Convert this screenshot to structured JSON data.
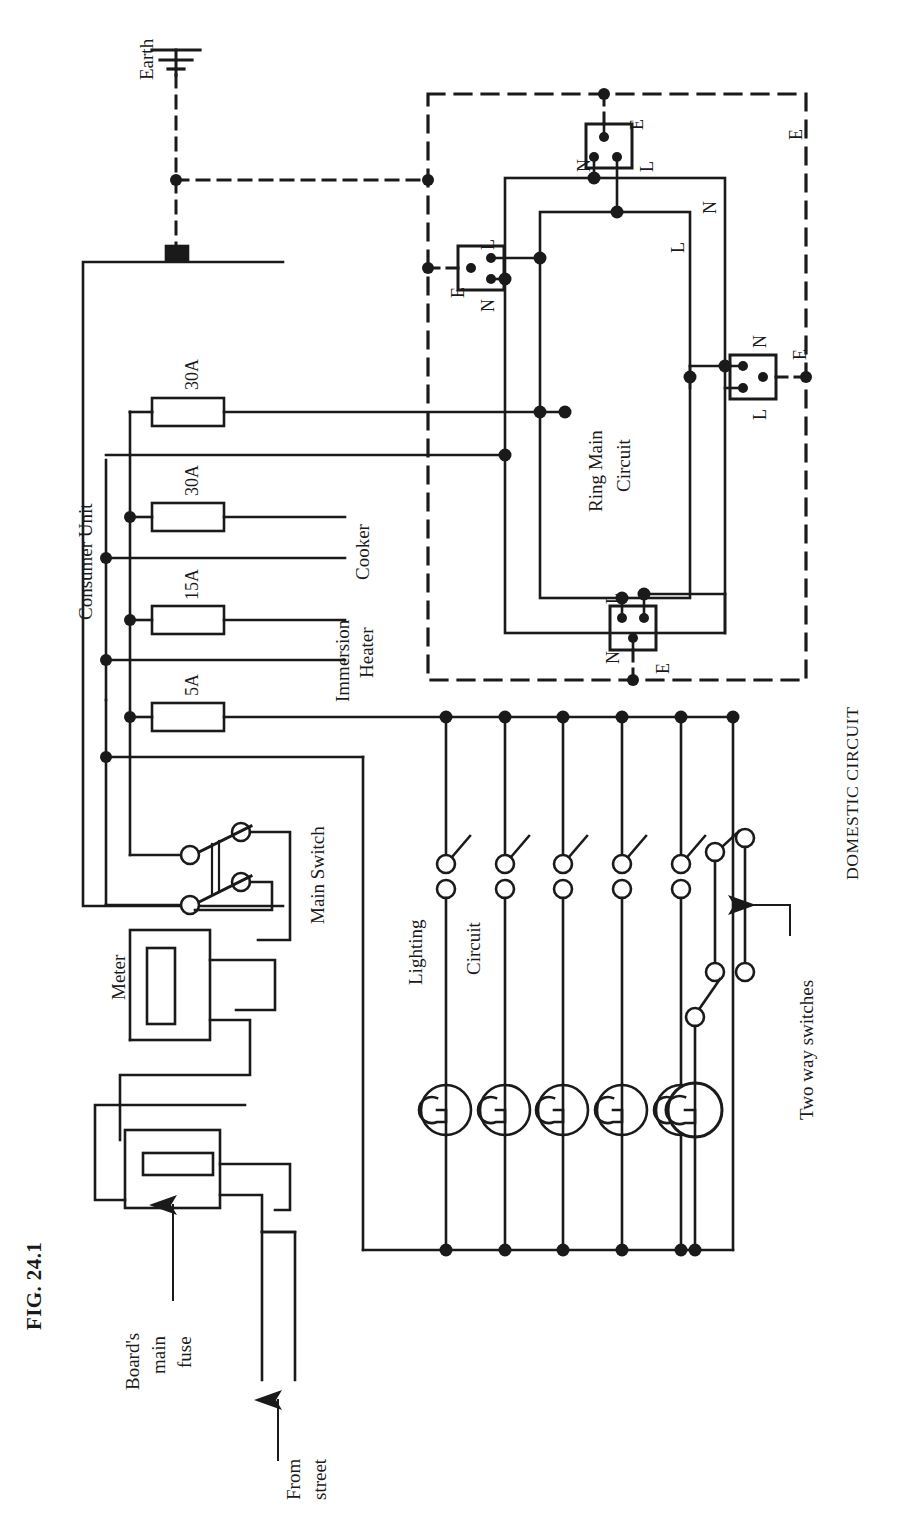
{
  "figure": {
    "number": "FIG. 24.1",
    "caption": "DOMESTIC CIRCUIT",
    "orientation": "rotated-90-ccw",
    "page_size": {
      "width": 900,
      "height": 1524
    }
  },
  "supply": {
    "source_label": "From\nstreet",
    "source_line1": "From",
    "source_line2": "street",
    "earth_label": "Earth",
    "board_fuse_label": "Board's\nmain\nfuse",
    "board_fuse_line1": "Board's",
    "board_fuse_line2": "main",
    "board_fuse_line3": "fuse",
    "meter_label": "Meter",
    "main_switch_label": "Main Switch"
  },
  "consumer_unit": {
    "title": "Consumer Unit",
    "fuses": [
      {
        "rating": "30A",
        "serves": "Ring Main Circuit"
      },
      {
        "rating": "30A",
        "serves": "Cooker"
      },
      {
        "rating": "15A",
        "serves": "Immersion Heater"
      },
      {
        "rating": "5A",
        "serves": "Lighting Circuit"
      }
    ],
    "fuse_ratings": [
      "30A",
      "30A",
      "15A",
      "5A"
    ],
    "load_labels": [
      "Cooker",
      "Immersion",
      "Heater"
    ],
    "cooker_label": "Cooker",
    "immersion_label_line1": "Immersion",
    "immersion_label_line2": "Heater"
  },
  "ring_main": {
    "title_line1": "Ring Main",
    "title_line2": "Circuit",
    "title": "Ring Main Circuit",
    "conductor_labels": {
      "live": "L",
      "neutral": "N",
      "earth": "E"
    },
    "sockets": [
      {
        "id": "socket-top",
        "terminals": [
          "N",
          "L",
          "E"
        ]
      },
      {
        "id": "socket-left",
        "terminals": [
          "L",
          "N",
          "E"
        ]
      },
      {
        "id": "socket-right",
        "terminals": [
          "N",
          "L",
          "E"
        ]
      },
      {
        "id": "socket-bottom",
        "terminals": [
          "L",
          "N",
          "E"
        ]
      }
    ],
    "boundary_earth_label": "E",
    "bus_labels": [
      "N",
      "L",
      "L",
      "N"
    ]
  },
  "lighting": {
    "label_line1": "Lighting",
    "label_line2": "Circuit",
    "label": "Lighting Circuit",
    "lamp_count": 6,
    "two_way_label": "Two way switches"
  },
  "colors": {
    "ink": "#1a1a1a",
    "paper": "#ffffff"
  }
}
